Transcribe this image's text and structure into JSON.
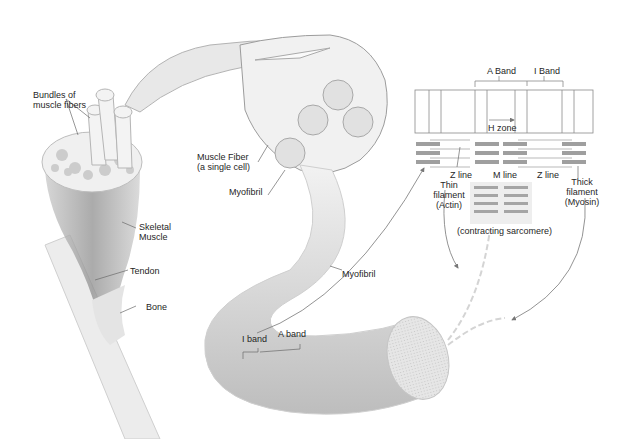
{
  "diagram": {
    "labels": {
      "bundles": "Bundles of",
      "bundles2": "muscle fibers",
      "skeletal": "Skeletal",
      "skeletal2": "Muscle",
      "tendon": "Tendon",
      "bone": "Bone",
      "fiber": "Muscle Fiber",
      "fiber2": "(a single cell)",
      "myofibril_top": "Myofibril",
      "myofibril_mid": "Myofibril",
      "i_band_small": "I band",
      "a_band_small": "A band",
      "a_band": "A Band",
      "i_band": "I Band",
      "h_zone": "H zone",
      "z_line_left": "Z line",
      "m_line": "M line",
      "z_line_right": "Z line",
      "thin": "Thin",
      "thin2": "filament",
      "thin3": "(Actin)",
      "thick": "Thick",
      "thick2": "filament",
      "thick3": "(Myosin)",
      "contracting": "(contracting sarcomere)"
    },
    "colors": {
      "line": "#555555",
      "tissue": "#d9d9d9",
      "tissue_dark": "#a9a9a9",
      "filament": "#9a9a9a"
    }
  }
}
